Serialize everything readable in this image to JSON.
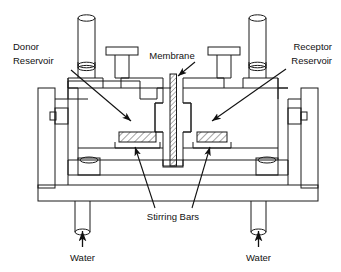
{
  "figure": {
    "background_color": "#ffffff",
    "line_color": "#1a1a1a",
    "hatch_color": "#555555"
  },
  "labels": {
    "donor_reservoir": {
      "line1": "Donor",
      "line2": "Reservoir",
      "align": "left"
    },
    "receptor_reservoir": {
      "line1": "Receptor",
      "line2": "Reservoir",
      "align": "right"
    },
    "membrane": {
      "text": "Membrane"
    },
    "stirring_bars": {
      "text": "Stirring Bars"
    },
    "water_left": {
      "text": "Water"
    },
    "water_right": {
      "text": "Water"
    }
  },
  "parts": {
    "membrane_name": "membrane-strip",
    "stir_bar_left_name": "stirring-bar-left",
    "stir_bar_right_name": "stirring-bar-right",
    "sampling_port_left_name": "sampling-port-left",
    "sampling_port_right_name": "sampling-port-right",
    "stopper_left_name": "stopper-left",
    "stopper_right_name": "stopper-right",
    "water_inlet_left_name": "water-inlet-left",
    "water_inlet_right_name": "water-inlet-right",
    "jacket_frame_left_name": "water-jacket-left",
    "jacket_frame_right_name": "water-jacket-right",
    "base_plate_name": "base-plate"
  }
}
